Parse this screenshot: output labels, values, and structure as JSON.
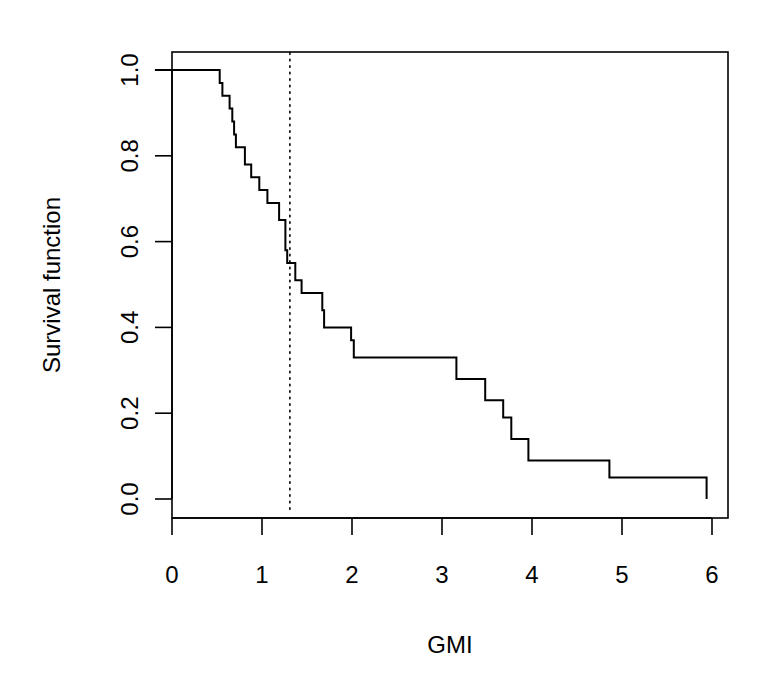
{
  "chart_data": {
    "type": "line",
    "subtype": "step",
    "title": "",
    "xlabel": "GMI",
    "ylabel": "Survival function",
    "xlim": [
      0,
      6
    ],
    "ylim": [
      0,
      1
    ],
    "x_ticks": [
      "0",
      "1",
      "2",
      "3",
      "4",
      "5",
      "6"
    ],
    "y_ticks": [
      "0.0",
      "0.2",
      "0.4",
      "0.6",
      "0.8",
      "1.0"
    ],
    "grid": false,
    "legend": null,
    "series": [
      {
        "name": "Kaplan-Meier survival",
        "style": "solid-step",
        "points": [
          [
            -0.19,
            1.0
          ],
          [
            0.53,
            1.0
          ],
          [
            0.53,
            0.97
          ],
          [
            0.56,
            0.97
          ],
          [
            0.56,
            0.94
          ],
          [
            0.64,
            0.94
          ],
          [
            0.64,
            0.91
          ],
          [
            0.67,
            0.91
          ],
          [
            0.67,
            0.88
          ],
          [
            0.69,
            0.88
          ],
          [
            0.69,
            0.85
          ],
          [
            0.71,
            0.85
          ],
          [
            0.71,
            0.82
          ],
          [
            0.81,
            0.82
          ],
          [
            0.81,
            0.78
          ],
          [
            0.88,
            0.78
          ],
          [
            0.88,
            0.75
          ],
          [
            0.97,
            0.75
          ],
          [
            0.97,
            0.72
          ],
          [
            1.06,
            0.72
          ],
          [
            1.06,
            0.69
          ],
          [
            1.19,
            0.69
          ],
          [
            1.19,
            0.65
          ],
          [
            1.26,
            0.65
          ],
          [
            1.26,
            0.58
          ],
          [
            1.28,
            0.58
          ],
          [
            1.28,
            0.55
          ],
          [
            1.37,
            0.55
          ],
          [
            1.37,
            0.51
          ],
          [
            1.44,
            0.51
          ],
          [
            1.44,
            0.48
          ],
          [
            1.67,
            0.48
          ],
          [
            1.67,
            0.44
          ],
          [
            1.69,
            0.44
          ],
          [
            1.69,
            0.4
          ],
          [
            1.99,
            0.4
          ],
          [
            1.99,
            0.37
          ],
          [
            2.02,
            0.37
          ],
          [
            2.02,
            0.33
          ],
          [
            3.16,
            0.33
          ],
          [
            3.16,
            0.28
          ],
          [
            3.48,
            0.28
          ],
          [
            3.48,
            0.23
          ],
          [
            3.68,
            0.23
          ],
          [
            3.68,
            0.19
          ],
          [
            3.77,
            0.19
          ],
          [
            3.77,
            0.14
          ],
          [
            3.96,
            0.14
          ],
          [
            3.96,
            0.09
          ],
          [
            4.86,
            0.09
          ],
          [
            4.86,
            0.05
          ],
          [
            5.94,
            0.05
          ],
          [
            5.94,
            0.0
          ]
        ]
      }
    ],
    "annotations": [
      {
        "type": "vline",
        "x": 1.31,
        "style": "dotted",
        "y_from": -0.03,
        "y_to": 1.04
      }
    ]
  }
}
